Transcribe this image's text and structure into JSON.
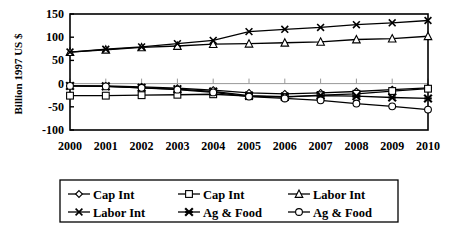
{
  "chart_data": {
    "type": "line",
    "title": "",
    "xlabel": "",
    "ylabel": "Billion 1997 US $",
    "x": [
      2000,
      2001,
      2002,
      2003,
      2004,
      2005,
      2006,
      2007,
      2008,
      2009,
      2010
    ],
    "xtick_labels": [
      "2000",
      "2001",
      "2002",
      "2003",
      "2004",
      "2005",
      "2006",
      "2007",
      "2008",
      "2009",
      "2010"
    ],
    "ytick_labels": [
      "150",
      "100",
      "50",
      "0",
      "-50",
      "-100"
    ],
    "yticks": [
      150,
      100,
      50,
      0,
      -50,
      -100
    ],
    "ylim": [
      -100,
      150
    ],
    "xlim": [
      2000,
      2010
    ],
    "grid": false,
    "zero_line": true,
    "legend_position": "bottom",
    "series": [
      {
        "name": "Cap Int",
        "marker": "diamond-open",
        "values": [
          -5,
          -5,
          -7,
          -10,
          -14,
          -20,
          -22,
          -20,
          -17,
          -13,
          -9
        ]
      },
      {
        "name": "Cap Int",
        "marker": "square-open",
        "values": [
          -26,
          -26,
          -25,
          -24,
          -23,
          -27,
          -29,
          -25,
          -22,
          -16,
          -11
        ]
      },
      {
        "name": "Labor Int",
        "marker": "triangle-open",
        "values": [
          68,
          73,
          78,
          81,
          85,
          86,
          88,
          90,
          95,
          97,
          102
        ]
      },
      {
        "name": "Labor Int",
        "marker": "cross",
        "values": [
          68,
          74,
          79,
          86,
          93,
          112,
          117,
          121,
          127,
          131,
          136
        ]
      },
      {
        "name": "Ag & Food",
        "marker": "star-filled",
        "values": [
          -5,
          -6,
          -9,
          -12,
          -17,
          -26,
          -28,
          -26,
          -27,
          -30,
          -32
        ]
      },
      {
        "name": "Ag & Food",
        "marker": "circle-open",
        "values": [
          -5,
          -6,
          -9,
          -13,
          -19,
          -28,
          -32,
          -36,
          -43,
          -49,
          -56
        ]
      }
    ]
  },
  "axis": {
    "y_title": "Billion 1997 US $"
  },
  "legend": {
    "entries": [
      {
        "label": "Cap Int",
        "marker": "diamond-open"
      },
      {
        "label": "Cap Int",
        "marker": "square-open"
      },
      {
        "label": "Labor Int",
        "marker": "triangle-open"
      },
      {
        "label": "Labor Int",
        "marker": "cross"
      },
      {
        "label": "Ag & Food",
        "marker": "star-filled"
      },
      {
        "label": "Ag & Food",
        "marker": "circle-open"
      }
    ]
  },
  "colors": {
    "line": "#000000",
    "frame": "#000000",
    "zero_line": "#999999",
    "background": "#ffffff"
  }
}
